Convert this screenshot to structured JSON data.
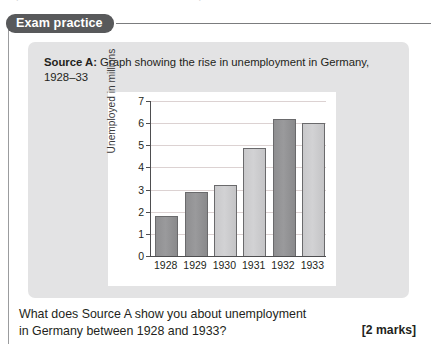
{
  "page": {
    "top_cutoff_text": "a period of severe economic hardship"
  },
  "banner": {
    "label": "Exam practice"
  },
  "source": {
    "lead": "Source A:",
    "caption": " Graph showing the rise in unemployment in Germany, 1928–33"
  },
  "question": {
    "text": "What does Source A show you about unemployment in Germany between 1928 and 1933?",
    "marks": "[2 marks]"
  },
  "chart_data": {
    "type": "bar",
    "title": "Graph showing the rise in unemployment in Germany, 1928–33",
    "xlabel": "",
    "ylabel": "Unemployed in millions",
    "categories": [
      "1928",
      "1929",
      "1930",
      "1931",
      "1932",
      "1933"
    ],
    "values": [
      1.8,
      2.9,
      3.2,
      4.9,
      6.2,
      6.0
    ],
    "ylim": [
      0,
      7
    ],
    "ytick_labels": [
      "0",
      "1",
      "2",
      "3",
      "4",
      "5",
      "6",
      "7"
    ],
    "ytick_values": [
      0,
      1,
      2,
      3,
      4,
      5,
      6,
      7
    ],
    "grid": true,
    "legend": "none",
    "bar_shades": [
      "dark",
      "dark",
      "light",
      "light",
      "dark",
      "light"
    ],
    "colors": {
      "bar_dark": "#969698",
      "bar_light": "#cccccE",
      "bar_border": "#6a6a6c",
      "gridline": "#dcd2d2",
      "axis": "#4e4e50",
      "panel_bg": "#ffffff"
    }
  },
  "colors": {
    "banner_bg": "#58595b",
    "source_panel_bg": "#e3e3e4",
    "text": "#231f20",
    "rule": "#7b7c7e"
  }
}
